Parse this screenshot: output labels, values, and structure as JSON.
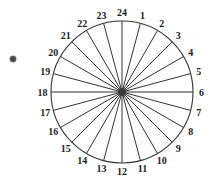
{
  "figure": {
    "bullet": {
      "color": "#4d4d4d"
    },
    "wheel": {
      "type": "sector-divided-circle",
      "sector_count": 24,
      "labels": [
        "1",
        "2",
        "3",
        "4",
        "5",
        "6",
        "7",
        "8",
        "9",
        "10",
        "11",
        "12",
        "13",
        "14",
        "15",
        "16",
        "17",
        "18",
        "19",
        "20",
        "21",
        "22",
        "23",
        "24"
      ],
      "top_label": "24",
      "label_direction": "clockwise",
      "degrees_per_sector": 15,
      "stroke_color": "#333333",
      "text_color": "#1c1c1c",
      "hub_color": "#3a3a3a",
      "background": "#ffffff",
      "layout": {
        "canvas_w": 210,
        "canvas_h": 191,
        "center_x": 122,
        "center_y": 92,
        "radius": 71,
        "label_radius": 79.5,
        "hub_radius": 4,
        "font_size": 10,
        "bullet_cx": 12.5,
        "bullet_cy": 58.5
      }
    }
  }
}
